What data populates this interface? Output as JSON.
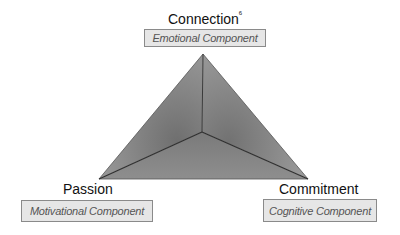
{
  "diagram": {
    "type": "triangle",
    "vertices": {
      "top": {
        "title": "Connection",
        "superscript": "6",
        "component": "Emotional Component"
      },
      "left": {
        "title": "Passion",
        "component": "Motivational Component"
      },
      "right": {
        "title": "Commitment",
        "component": "Cognitive Component"
      }
    },
    "colors": {
      "face_light": "#9a9a9a",
      "face_dark": "#6e6e6e",
      "edge": "#3a3a3a",
      "box_fill": "#e6e6e6",
      "box_border": "#8a8a8a"
    }
  }
}
